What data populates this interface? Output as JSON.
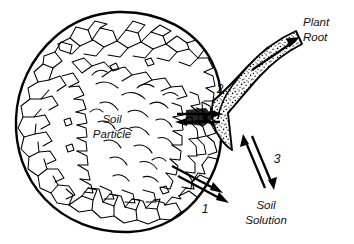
{
  "figure": {
    "background_color": "#ffffff",
    "ink_color": "#000000"
  },
  "labels": {
    "plant_root_line1": "Plant",
    "plant_root_line2": "Root",
    "soil_particle_line1": "Soil",
    "soil_particle_line2": "Particle",
    "soil_solution_line1": "Soil",
    "soil_solution_line2": "Solution"
  },
  "callouts": {
    "one": "1",
    "two": "2",
    "three": "3"
  },
  "parts": {
    "soil_particle_name": "soil-particle",
    "plant_root_name": "plant-root",
    "contact_zone_name": "root-particle-contact"
  }
}
